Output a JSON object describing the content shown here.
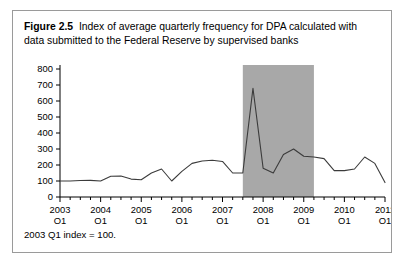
{
  "figure": {
    "label": "Figure 2.5",
    "caption": "Index of average quarterly frequency for DPA calculated with data submitted to the Federal Reserve by supervised banks",
    "footnote": "2003 Q1 index = 100.",
    "border_color": "#9a9a9a",
    "background_color": "#ffffff"
  },
  "chart_data": {
    "type": "line",
    "title": "Index of average quarterly frequency for DPA calculated with data submitted to the Federal Reserve by supervised banks",
    "xlabel": "",
    "ylabel": "",
    "ylim": [
      0,
      800
    ],
    "yticks": [
      0,
      100,
      200,
      300,
      400,
      500,
      600,
      700,
      800
    ],
    "ytick_labels": [
      "0",
      "100",
      "200",
      "300",
      "400",
      "500",
      "600",
      "700",
      "800"
    ],
    "xlim": [
      "2003 Q1",
      "2011 Q1"
    ],
    "xtick_labels": [
      "2003\nQ1",
      "2004\nQ1",
      "2005\nQ1",
      "2006\nQ1",
      "2007\nQ1",
      "2008\nQ1",
      "2009\nQ1",
      "2010\nQ1",
      "2011\nQ1"
    ],
    "xtick_years": [
      "2003",
      "2004",
      "2005",
      "2006",
      "2007",
      "2008",
      "2009",
      "2010",
      "2011"
    ],
    "xtick_quarter": "Q1",
    "grid": false,
    "legend": null,
    "line_color": "#3b3b3b",
    "line_width": 1.1,
    "x": [
      "2003 Q1",
      "2003 Q2",
      "2003 Q3",
      "2003 Q4",
      "2004 Q1",
      "2004 Q2",
      "2004 Q3",
      "2004 Q4",
      "2005 Q1",
      "2005 Q2",
      "2005 Q3",
      "2005 Q4",
      "2006 Q1",
      "2006 Q2",
      "2006 Q3",
      "2006 Q4",
      "2007 Q1",
      "2007 Q2",
      "2007 Q3",
      "2007 Q4",
      "2008 Q1",
      "2008 Q2",
      "2008 Q3",
      "2008 Q4",
      "2009 Q1",
      "2009 Q2",
      "2009 Q3",
      "2009 Q4",
      "2010 Q1",
      "2010 Q2",
      "2010 Q3",
      "2010 Q4",
      "2011 Q1"
    ],
    "values": [
      100,
      100,
      103,
      104,
      100,
      130,
      131,
      112,
      108,
      150,
      175,
      100,
      160,
      210,
      225,
      230,
      222,
      150,
      150,
      680,
      180,
      150,
      265,
      300,
      255,
      250,
      240,
      165,
      165,
      175,
      250,
      210,
      90
    ],
    "shaded_region": {
      "label": "recession",
      "start": "2007 Q3",
      "end": "2009 Q2",
      "color": "#a8a8a8"
    }
  }
}
